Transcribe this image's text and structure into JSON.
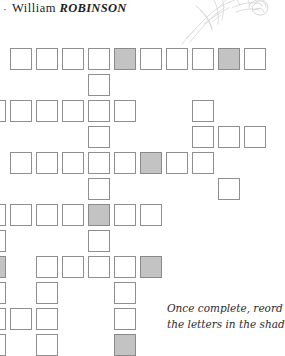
{
  "header": {
    "bullet": "·",
    "first_name": "William",
    "surname": "ROBINSON"
  },
  "illustration": {
    "icon_name": "botanical-sketch-icon",
    "description": "faint pencil sketch of a flower stem"
  },
  "instructions": {
    "line1": "Once complete, reord",
    "line2": "the letters in the shad"
  },
  "grid": {
    "cell_size": 22,
    "col_pitch": 26,
    "row_pitch": 26,
    "col0_x": -16,
    "row0_y": 48,
    "shade_color": "#c3c3c3",
    "border_color": "#8e8e8e",
    "cells": [
      {
        "r": 0,
        "c": 1,
        "shaded": false
      },
      {
        "r": 0,
        "c": 2,
        "shaded": false
      },
      {
        "r": 0,
        "c": 3,
        "shaded": false
      },
      {
        "r": 0,
        "c": 4,
        "shaded": false
      },
      {
        "r": 0,
        "c": 5,
        "shaded": true
      },
      {
        "r": 0,
        "c": 6,
        "shaded": false
      },
      {
        "r": 0,
        "c": 7,
        "shaded": false
      },
      {
        "r": 0,
        "c": 8,
        "shaded": false
      },
      {
        "r": 0,
        "c": 9,
        "shaded": true
      },
      {
        "r": 0,
        "c": 10,
        "shaded": false
      },
      {
        "r": 1,
        "c": 4,
        "shaded": false
      },
      {
        "r": 2,
        "c": 0,
        "shaded": false
      },
      {
        "r": 2,
        "c": 1,
        "shaded": false
      },
      {
        "r": 2,
        "c": 2,
        "shaded": false
      },
      {
        "r": 2,
        "c": 3,
        "shaded": false
      },
      {
        "r": 2,
        "c": 4,
        "shaded": false
      },
      {
        "r": 2,
        "c": 5,
        "shaded": false
      },
      {
        "r": 2,
        "c": 8,
        "shaded": false
      },
      {
        "r": 3,
        "c": 4,
        "shaded": false
      },
      {
        "r": 3,
        "c": 8,
        "shaded": false
      },
      {
        "r": 3,
        "c": 9,
        "shaded": false
      },
      {
        "r": 3,
        "c": 10,
        "shaded": false
      },
      {
        "r": 4,
        "c": 1,
        "shaded": false
      },
      {
        "r": 4,
        "c": 2,
        "shaded": false
      },
      {
        "r": 4,
        "c": 3,
        "shaded": false
      },
      {
        "r": 4,
        "c": 4,
        "shaded": false
      },
      {
        "r": 4,
        "c": 5,
        "shaded": false
      },
      {
        "r": 4,
        "c": 6,
        "shaded": true
      },
      {
        "r": 4,
        "c": 7,
        "shaded": false
      },
      {
        "r": 4,
        "c": 8,
        "shaded": false
      },
      {
        "r": 5,
        "c": 4,
        "shaded": false
      },
      {
        "r": 5,
        "c": 9,
        "shaded": false
      },
      {
        "r": 6,
        "c": 0,
        "shaded": false
      },
      {
        "r": 6,
        "c": 1,
        "shaded": false
      },
      {
        "r": 6,
        "c": 2,
        "shaded": false
      },
      {
        "r": 6,
        "c": 3,
        "shaded": false
      },
      {
        "r": 6,
        "c": 4,
        "shaded": true
      },
      {
        "r": 6,
        "c": 5,
        "shaded": false
      },
      {
        "r": 6,
        "c": 6,
        "shaded": false
      },
      {
        "r": 7,
        "c": 0,
        "shaded": false
      },
      {
        "r": 7,
        "c": 4,
        "shaded": false
      },
      {
        "r": 8,
        "c": 0,
        "shaded": true
      },
      {
        "r": 8,
        "c": 2,
        "shaded": false
      },
      {
        "r": 8,
        "c": 3,
        "shaded": false
      },
      {
        "r": 8,
        "c": 4,
        "shaded": false
      },
      {
        "r": 8,
        "c": 5,
        "shaded": false
      },
      {
        "r": 8,
        "c": 6,
        "shaded": true
      },
      {
        "r": 9,
        "c": 0,
        "shaded": false
      },
      {
        "r": 9,
        "c": 2,
        "shaded": false
      },
      {
        "r": 9,
        "c": 5,
        "shaded": false
      },
      {
        "r": 10,
        "c": 0,
        "shaded": false
      },
      {
        "r": 10,
        "c": 1,
        "shaded": false
      },
      {
        "r": 10,
        "c": 2,
        "shaded": false
      },
      {
        "r": 10,
        "c": 5,
        "shaded": false
      },
      {
        "r": 11,
        "c": 0,
        "shaded": false
      },
      {
        "r": 11,
        "c": 2,
        "shaded": false
      },
      {
        "r": 11,
        "c": 5,
        "shaded": true
      }
    ]
  }
}
